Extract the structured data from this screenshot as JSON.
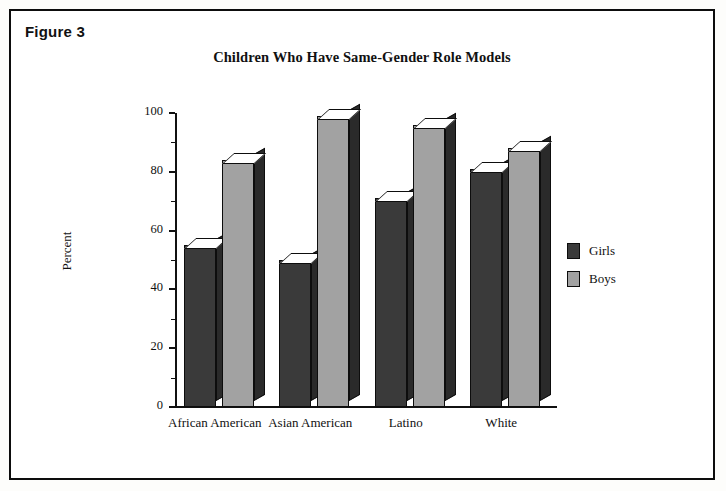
{
  "figure": {
    "label": "Figure 3"
  },
  "chart_data": {
    "type": "bar",
    "title": "Children Who Have Same-Gender Role Models",
    "xlabel": "",
    "ylabel": "Percent",
    "ylim": [
      0,
      100
    ],
    "ytick_labels": [
      "0",
      "20",
      "40",
      "60",
      "80",
      "100"
    ],
    "ytick_values": [
      0,
      20,
      40,
      60,
      80,
      100
    ],
    "grid": false,
    "legend_position": "right",
    "categories": [
      "African American",
      "Asian American",
      "Latino",
      "White"
    ],
    "series": [
      {
        "name": "Girls",
        "color": "#3a3a3a",
        "values": [
          55,
          50,
          71,
          81
        ]
      },
      {
        "name": "Boys",
        "color": "#a2a2a2",
        "values": [
          84,
          99,
          96,
          88
        ]
      }
    ]
  }
}
